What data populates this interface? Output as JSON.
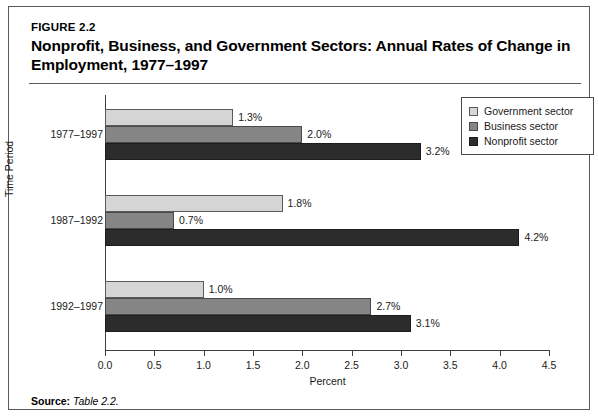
{
  "figure": {
    "number": "FIGURE 2.2",
    "title": "Nonprofit, Business, and Government Sectors: Annual Rates of Change in Employment, 1977–1997",
    "source_label": "Source:",
    "source_value": "Table 2.2."
  },
  "chart_data": {
    "type": "bar",
    "orientation": "horizontal",
    "title": "Nonprofit, Business, and Government Sectors: Annual Rates of Change in Employment, 1977–1997",
    "xlabel": "Percent",
    "ylabel": "Time Period",
    "categories": [
      "1977–1997",
      "1987–1992",
      "1992–1997"
    ],
    "series": [
      {
        "name": "Government sector",
        "color": "#d5d5d5",
        "values": [
          1.3,
          1.8,
          1.0
        ],
        "labels": [
          "1.3%",
          "1.8%",
          "1.0%"
        ]
      },
      {
        "name": "Business sector",
        "color": "#858585",
        "values": [
          2.0,
          0.7,
          2.7
        ],
        "labels": [
          "2.0%",
          "0.7%",
          "2.7%"
        ]
      },
      {
        "name": "Nonprofit sector",
        "color": "#2c2c2c",
        "values": [
          3.2,
          4.2,
          3.1
        ],
        "labels": [
          "3.2%",
          "4.2%",
          "3.1%"
        ]
      }
    ],
    "xlim": [
      0.0,
      4.5
    ],
    "xticks": [
      0.0,
      0.5,
      1.0,
      1.5,
      2.0,
      2.5,
      3.0,
      3.5,
      4.0,
      4.5
    ],
    "xtick_labels": [
      "0.0",
      "0.5",
      "1.0",
      "1.5",
      "2.0",
      "2.5",
      "3.0",
      "3.5",
      "4.0",
      "4.5"
    ],
    "grid": false,
    "legend_position": "top-right",
    "legend_entries": [
      "Government sector",
      "Business sector",
      "Nonprofit sector"
    ]
  }
}
